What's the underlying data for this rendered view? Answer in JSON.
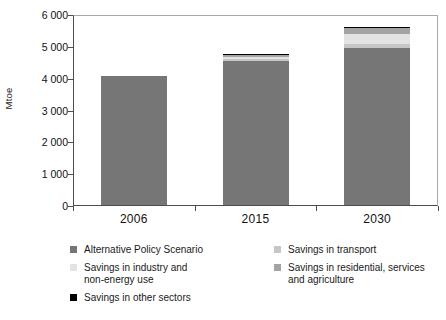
{
  "chart_data": {
    "type": "bar",
    "subtype": "stacked-bar",
    "title": "",
    "subtitle": "",
    "xlabel": "",
    "ylabel": "Mtoe",
    "categories": [
      "2006",
      "2015",
      "2030"
    ],
    "ylim": [
      0,
      6000
    ],
    "ytick_values": [
      0,
      1000,
      2000,
      3000,
      4000,
      5000,
      6000
    ],
    "ytick_labels": [
      "0",
      "1 000",
      "2 000",
      "3 000",
      "4 000",
      "5 000",
      "6 000"
    ],
    "grid": false,
    "legend_position": "below",
    "series": [
      {
        "name": "Alternative Policy Scenario",
        "color": "#767676",
        "values": [
          4050,
          4520,
          4930
        ]
      },
      {
        "name": "Savings in transport",
        "color": "#c6c6c6",
        "values": [
          0,
          60,
          130
        ]
      },
      {
        "name": "Savings in industry and non-energy use",
        "color": "#e3e3e3",
        "values": [
          0,
          65,
          300
        ]
      },
      {
        "name": "Savings in residential, services and agriculture",
        "color": "#a3a3a3",
        "values": [
          0,
          55,
          200
        ]
      },
      {
        "name": "Savings in other sectors",
        "color": "#000000",
        "values": [
          0,
          30,
          40
        ]
      }
    ],
    "totals": [
      4050,
      4730,
      5600
    ]
  },
  "axes": {
    "y_title": "Mtoe",
    "y_ticks": [
      {
        "label": "6 000",
        "value": 6000
      },
      {
        "label": "5 000",
        "value": 5000
      },
      {
        "label": "4 000",
        "value": 4000
      },
      {
        "label": "3 000",
        "value": 3000
      },
      {
        "label": "2 000",
        "value": 2000
      },
      {
        "label": "1 000",
        "value": 1000
      },
      {
        "label": "0",
        "value": 0
      }
    ],
    "x_ticks": [
      {
        "label": "2006"
      },
      {
        "label": "2015"
      },
      {
        "label": "2030"
      }
    ]
  },
  "legend": {
    "left_column": [
      {
        "label": "Alternative Policy Scenario",
        "color": "#767676"
      },
      {
        "label": "Savings in industry and\nnon-energy use",
        "color": "#e3e3e3"
      },
      {
        "label": "Savings in other sectors",
        "color": "#000000"
      }
    ],
    "right_column": [
      {
        "label": "Savings in transport",
        "color": "#c6c6c6"
      },
      {
        "label": "Savings in residential, services\nand agriculture",
        "color": "#a3a3a3"
      }
    ]
  }
}
